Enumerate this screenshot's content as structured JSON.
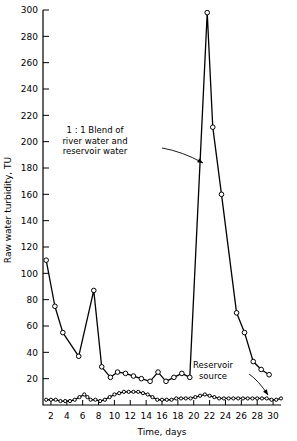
{
  "chart_data": {
    "type": "line",
    "title": "",
    "xlabel": "Time, days",
    "ylabel": "Raw water turbidity, TU",
    "xlim": [
      1,
      31
    ],
    "ylim": [
      0,
      300
    ],
    "xticks": [
      2,
      4,
      6,
      8,
      10,
      12,
      14,
      16,
      18,
      20,
      22,
      24,
      26,
      28,
      30
    ],
    "yticks": [
      20,
      40,
      60,
      80,
      100,
      120,
      140,
      160,
      180,
      200,
      220,
      240,
      260,
      280,
      300
    ],
    "grid": false,
    "legend": "none",
    "markers": "open-circle",
    "series": [
      {
        "name": "1 : 1 Blend of river water and reservoir water",
        "x": [
          1.4,
          2.5,
          3.5,
          5.5,
          7.4,
          8.4,
          9.5,
          10.4,
          11.4,
          12.4,
          13.4,
          14.5,
          15.5,
          16.5,
          17.5,
          18.5,
          19.5,
          21.7,
          22.4,
          23.5,
          25.4,
          26.4,
          27.5,
          28.5,
          29.5
        ],
        "y": [
          110,
          75,
          55,
          37,
          87,
          29,
          21,
          25,
          24,
          22,
          20,
          18,
          25,
          18,
          21,
          24,
          21,
          298,
          211,
          160,
          70,
          55,
          33,
          27,
          23
        ]
      },
      {
        "name": "Reservoir source",
        "x": [
          1.4,
          2.0,
          2.6,
          3.2,
          3.8,
          4.4,
          5.0,
          5.6,
          6.2,
          6.6,
          7.0,
          7.6,
          8.2,
          8.8,
          9.4,
          10.0,
          10.6,
          11.2,
          11.8,
          12.4,
          13.0,
          13.6,
          14.2,
          14.8,
          15.4,
          16.0,
          16.6,
          17.2,
          17.8,
          18.4,
          19.0,
          19.6,
          20.2,
          20.8,
          21.4,
          22.0,
          22.6,
          23.2,
          23.8,
          24.4,
          25.0,
          25.6,
          26.2,
          26.8,
          27.4,
          28.0,
          28.6,
          29.2,
          29.8,
          30.4,
          31.0
        ],
        "y": [
          4,
          4,
          4,
          3,
          3,
          3,
          4,
          6,
          8,
          6,
          4,
          4,
          3,
          4,
          6,
          8,
          9,
          10,
          10,
          10,
          10,
          9,
          8,
          6,
          4,
          4,
          4,
          4,
          5,
          5,
          5,
          5,
          6,
          7,
          8,
          7,
          6,
          5,
          5,
          5,
          5,
          5,
          5,
          5,
          5,
          5,
          5,
          5,
          4,
          4,
          5
        ]
      }
    ],
    "annotations": [
      {
        "id": "blend-annotation",
        "lines": [
          "1 : 1 Blend of",
          "river water and",
          "reservoir water"
        ],
        "text_x": 95,
        "text_y": 133,
        "arrow_from_x": 162,
        "arrow_from_y": 148,
        "arrow_to_x": 203,
        "arrow_to_y": 163
      },
      {
        "id": "reservoir-annotation",
        "lines": [
          "Reservoir",
          "source"
        ],
        "text_x": 213,
        "text_y": 368,
        "arrow_from_x": 249,
        "arrow_from_y": 374,
        "arrow_to_x": 268,
        "arrow_to_y": 395
      }
    ]
  }
}
